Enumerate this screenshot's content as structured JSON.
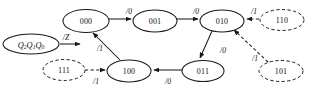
{
  "figure": {
    "type": "state-transition-diagram"
  },
  "input_node": {
    "name": "state-variable-node",
    "label_main": "Q",
    "label_parts": [
      "Q",
      "2",
      "Q",
      "1",
      "Q",
      "0"
    ],
    "text": "Q2Q1Q0",
    "arrow_label": "/Z",
    "style": "solid"
  },
  "states": [
    {
      "id": "s000",
      "label": "000",
      "style": "solid",
      "cx": 86,
      "cy": 21,
      "rx": 23,
      "ry": 11.5
    },
    {
      "id": "s001",
      "label": "001",
      "style": "solid",
      "cx": 155,
      "cy": 21,
      "rx": 22,
      "ry": 11.0
    },
    {
      "id": "s010",
      "label": "010",
      "style": "solid",
      "cx": 222,
      "cy": 21,
      "rx": 22,
      "ry": 11.0
    },
    {
      "id": "s110",
      "label": "110",
      "style": "dashed",
      "cx": 282,
      "cy": 20,
      "rx": 22,
      "ry": 10.5
    },
    {
      "id": "s101",
      "label": "101",
      "style": "dashed",
      "cx": 281,
      "cy": 71,
      "rx": 22,
      "ry": 10.5
    },
    {
      "id": "s011",
      "label": "011",
      "style": "solid",
      "cx": 203,
      "cy": 71,
      "rx": 21,
      "ry": 10.5
    },
    {
      "id": "s100",
      "label": "100",
      "style": "solid",
      "cx": 129,
      "cy": 71,
      "rx": 22,
      "ry": 11.0
    },
    {
      "id": "s111",
      "label": "111",
      "style": "dashed",
      "cx": 64,
      "cy": 70,
      "rx": 21,
      "ry": 10.5
    }
  ],
  "transitions": [
    {
      "id": "t-000-001",
      "from": "000",
      "to": "001",
      "label": "/0",
      "style": "solid",
      "label_x": 129,
      "label_y": 11
    },
    {
      "id": "t-001-010",
      "from": "001",
      "to": "010",
      "label": "/0",
      "style": "solid",
      "label_x": 196,
      "label_y": 11
    },
    {
      "id": "t-110-010",
      "from": "110",
      "to": "010",
      "label": "/1",
      "style": "dashed",
      "label_x": 254,
      "label_y": 11
    },
    {
      "id": "t-010-011",
      "from": "010",
      "to": "011",
      "label": "/0",
      "style": "solid",
      "label_x": 223,
      "label_y": 50
    },
    {
      "id": "t-101-010",
      "from": "101",
      "to": "010",
      "label": "/1",
      "style": "dashed",
      "label_x": 255,
      "label_y": 58
    },
    {
      "id": "t-011-100",
      "from": "011",
      "to": "100",
      "label": "/0",
      "style": "solid",
      "label_x": 168,
      "label_y": 81
    },
    {
      "id": "t-111-100",
      "from": "111",
      "to": "100",
      "label": "/1",
      "style": "dashed",
      "label_x": 96,
      "label_y": 81
    },
    {
      "id": "t-100-000",
      "from": "100",
      "to": "000",
      "label": "/1",
      "style": "solid",
      "label_x": 100,
      "label_y": 48
    }
  ]
}
